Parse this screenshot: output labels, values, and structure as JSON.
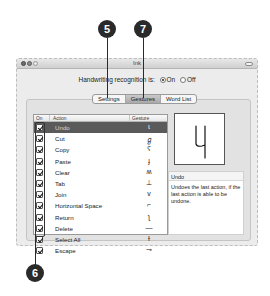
{
  "window": {
    "title": "Ink",
    "recognition_label": "Handwriting recognition is:",
    "radio_on_label": "On",
    "radio_off_label": "Off",
    "recognition_value": "On"
  },
  "tabs": [
    {
      "label": "Settings",
      "active": false
    },
    {
      "label": "Gestures",
      "active": true
    },
    {
      "label": "Word List",
      "active": false
    }
  ],
  "table": {
    "headers": {
      "on": "On",
      "action": "Action",
      "gesture": "Gesture"
    },
    "rows": [
      {
        "checked": true,
        "action": "Undo",
        "gesture": "ɩ",
        "selected": true
      },
      {
        "checked": true,
        "action": "Cut",
        "gesture": "ℊ",
        "selected": false
      },
      {
        "checked": true,
        "action": "Copy",
        "gesture": "ʕ",
        "selected": false
      },
      {
        "checked": true,
        "action": "Paste",
        "gesture": "ɟ",
        "selected": false
      },
      {
        "checked": true,
        "action": "Clear",
        "gesture": "ʍ",
        "selected": false
      },
      {
        "checked": true,
        "action": "Tab",
        "gesture": "⊥",
        "selected": false
      },
      {
        "checked": true,
        "action": "Join",
        "gesture": "v",
        "selected": false
      },
      {
        "checked": true,
        "action": "Horizontal Space",
        "gesture": "⌐",
        "selected": false
      },
      {
        "checked": true,
        "action": "Return",
        "gesture": "ʅ",
        "selected": false
      },
      {
        "checked": true,
        "action": "Delete",
        "gesture": "—",
        "selected": false
      },
      {
        "checked": true,
        "action": "Select All",
        "gesture": "ɫ",
        "selected": false
      },
      {
        "checked": true,
        "action": "Escape",
        "gesture": "⊸",
        "selected": false
      }
    ]
  },
  "preview": {
    "glyph_description": "handwritten 4-like undo gesture"
  },
  "description": {
    "title": "Undo",
    "body": "Undoes the last action, if the last action is able to be undone."
  },
  "callouts": [
    {
      "number": "5",
      "target": "Gestures tab"
    },
    {
      "number": "7",
      "target": "Word List tab"
    },
    {
      "number": "6",
      "target": "On checkbox column"
    }
  ],
  "colors": {
    "selection": "#5a5a5a",
    "window_bg": "#ececec",
    "callout": "#2a2a2a"
  }
}
